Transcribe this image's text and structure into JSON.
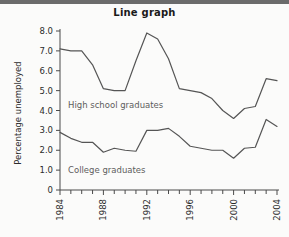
{
  "figure": {
    "title": "Line graph",
    "background_color": "#fbfbfa",
    "topbar_color": "#6b6b6b"
  },
  "chart_data": {
    "type": "line",
    "title": "Line graph",
    "xlabel": "",
    "ylabel": "Percentage unemployed",
    "xlim": [
      1984,
      2004
    ],
    "ylim": [
      0,
      8.0
    ],
    "grid": false,
    "legend_position": "inline-annotation",
    "x": [
      1984,
      1985,
      1986,
      1987,
      1988,
      1989,
      1990,
      1991,
      1992,
      1993,
      1994,
      1995,
      1996,
      1997,
      1998,
      1999,
      2000,
      2001,
      2002,
      2003,
      2004
    ],
    "xtick_labels": [
      "1984",
      "1988",
      "1992",
      "1996",
      "2000",
      "2004"
    ],
    "xtick_values": [
      1984,
      1988,
      1992,
      1996,
      2000,
      2004
    ],
    "xtick_minor_values": [
      1985,
      1986,
      1987,
      1989,
      1990,
      1991,
      1993,
      1994,
      1995,
      1997,
      1998,
      1999,
      2001,
      2002,
      2003
    ],
    "ytick_labels": [
      "0",
      "1.0",
      "2.0",
      "3.0",
      "4.0",
      "5.0",
      "6.0",
      "7.0",
      "8.0"
    ],
    "ytick_values": [
      0,
      1.0,
      2.0,
      3.0,
      4.0,
      5.0,
      6.0,
      7.0,
      8.0
    ],
    "line_color": "#555555",
    "series": [
      {
        "name": "High school graduates",
        "annotation": "High school graduates",
        "values": [
          7.1,
          7.0,
          7.0,
          6.3,
          5.1,
          5.0,
          5.0,
          6.5,
          7.9,
          7.6,
          6.6,
          5.1,
          5.0,
          4.9,
          4.6,
          4.0,
          3.6,
          4.1,
          4.2,
          5.6,
          5.5
        ]
      },
      {
        "name": "College graduates",
        "annotation": "College graduates",
        "values": [
          2.9,
          2.6,
          2.4,
          2.4,
          1.9,
          2.1,
          2.0,
          1.95,
          3.0,
          3.0,
          3.1,
          2.7,
          2.2,
          2.1,
          2.0,
          2.0,
          1.6,
          2.1,
          2.15,
          3.55,
          3.2
        ]
      }
    ]
  }
}
